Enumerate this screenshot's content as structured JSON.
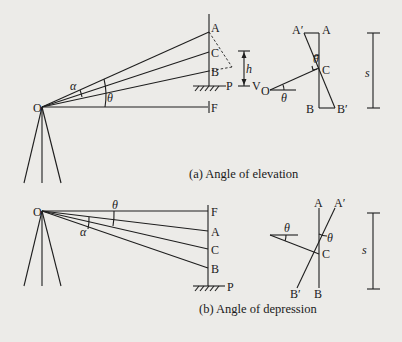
{
  "figure": {
    "panel_a": {
      "caption": "(a) Angle of elevation",
      "points": {
        "O": "O",
        "A": "A",
        "C": "C",
        "B": "B",
        "P": "P",
        "F": "F",
        "V": "V"
      },
      "angles": {
        "alpha": "α",
        "theta": "θ"
      },
      "dimension": "h",
      "inset": {
        "A_prime": "A′",
        "A": "A",
        "C": "C",
        "O": "O",
        "B": "B",
        "B_prime": "B′",
        "theta": "θ",
        "s": "s"
      }
    },
    "panel_b": {
      "caption": "(b) Angle of depression",
      "points": {
        "O": "O",
        "F": "F",
        "A": "A",
        "C": "C",
        "B": "B",
        "P": "P"
      },
      "angles": {
        "alpha": "α",
        "theta": "θ"
      },
      "inset": {
        "A": "A",
        "A_prime": "A′",
        "C": "C",
        "B_prime": "B′",
        "B": "B",
        "theta": "θ",
        "s": "s"
      }
    }
  },
  "colors": {
    "ink": "#1e1e1e",
    "paper": "#ecebe8"
  }
}
